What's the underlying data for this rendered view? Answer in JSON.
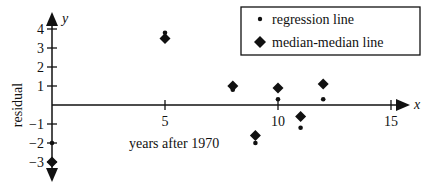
{
  "chart_data": {
    "type": "scatter",
    "title": "",
    "xlabel": "years after 1970",
    "ylabel": "residual",
    "x_axis_letter": "x",
    "y_axis_letter": "y",
    "xlim": [
      0,
      16
    ],
    "ylim": [
      -3.5,
      4.5
    ],
    "x_ticks": [
      5,
      10,
      15
    ],
    "x_tick_labels": [
      "5",
      "10",
      "15"
    ],
    "y_ticks": [
      4,
      3,
      2,
      1,
      -1,
      -2,
      -3
    ],
    "y_tick_labels": [
      "4",
      "3",
      "2",
      "1",
      "−1",
      "−2",
      "−3"
    ],
    "grid": false,
    "legend_position": "top-right",
    "series": [
      {
        "name": "regression line",
        "marker": "dot",
        "points": [
          {
            "x": 0,
            "y": -2.0
          },
          {
            "x": 5,
            "y": 3.8
          },
          {
            "x": 8,
            "y": 0.8
          },
          {
            "x": 9,
            "y": -2.0
          },
          {
            "x": 10,
            "y": 0.3
          },
          {
            "x": 11,
            "y": -1.2
          },
          {
            "x": 12,
            "y": 0.3
          }
        ]
      },
      {
        "name": "median-median line",
        "marker": "diamond",
        "points": [
          {
            "x": 0,
            "y": -3.0
          },
          {
            "x": 5,
            "y": 3.5
          },
          {
            "x": 8,
            "y": 1.0
          },
          {
            "x": 9,
            "y": -1.6
          },
          {
            "x": 10,
            "y": 0.9
          },
          {
            "x": 11,
            "y": -0.6
          },
          {
            "x": 12,
            "y": 1.1
          }
        ]
      }
    ]
  }
}
